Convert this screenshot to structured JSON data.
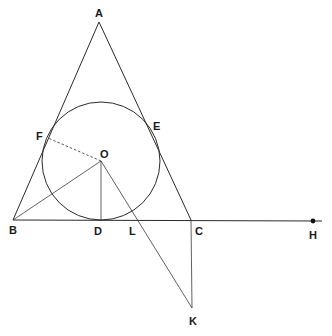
{
  "diagram": {
    "type": "geometry",
    "points": {
      "A": {
        "label": "A",
        "x": 99,
        "y": 22
      },
      "B": {
        "label": "B",
        "x": 13,
        "y": 220
      },
      "C": {
        "label": "C",
        "x": 191,
        "y": 220
      },
      "D": {
        "label": "D",
        "x": 101,
        "y": 220
      },
      "E": {
        "label": "E",
        "x": 150,
        "y": 120
      },
      "F": {
        "label": "F",
        "x": 48,
        "y": 138
      },
      "O": {
        "label": "O",
        "x": 101,
        "y": 161
      },
      "L": {
        "label": "L",
        "x": 135,
        "y": 220
      },
      "H": {
        "label": "H",
        "x": 313,
        "y": 221
      },
      "K": {
        "label": "K",
        "x": 192,
        "y": 308
      }
    },
    "circle": {
      "center": "O",
      "cx": 101,
      "cy": 161,
      "r": 59
    },
    "segments": [
      {
        "from": "A",
        "to": "B",
        "style": "solid"
      },
      {
        "from": "A",
        "to": "C",
        "style": "solid"
      },
      {
        "from": "B",
        "to": "H",
        "style": "solid"
      },
      {
        "from": "O",
        "to": "B",
        "style": "solid"
      },
      {
        "from": "O",
        "to": "D",
        "style": "solid"
      },
      {
        "from": "O",
        "to": "F",
        "style": "dashed"
      },
      {
        "from": "O",
        "to": "K",
        "style": "solid"
      },
      {
        "from": "C",
        "to": "K",
        "style": "solid"
      }
    ],
    "labels": {
      "A": "A",
      "B": "B",
      "C": "C",
      "D": "D",
      "E": "E",
      "F": "F",
      "O": "O",
      "L": "L",
      "H": "H",
      "K": "K"
    }
  }
}
